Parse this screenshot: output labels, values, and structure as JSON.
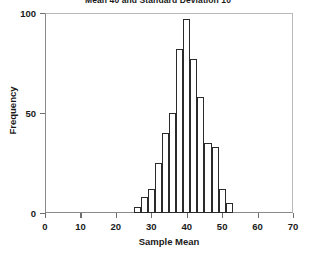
{
  "chart_data": {
    "type": "bar",
    "title": "Mean 40 and Standard Deviation 10",
    "xlabel": "Sample Mean",
    "ylabel": "Frequency",
    "xlim": [
      0,
      70
    ],
    "ylim": [
      0,
      100
    ],
    "xticks": [
      0,
      10,
      20,
      30,
      40,
      50,
      60,
      70
    ],
    "yticks": [
      0,
      50,
      100
    ],
    "grid": false,
    "legend": null,
    "bin_width": 2,
    "bin_edges": [
      25,
      27,
      29,
      31,
      33,
      35,
      37,
      39,
      41,
      43,
      45,
      47,
      49,
      51,
      53
    ],
    "categories": [
      "25-27",
      "27-29",
      "29-31",
      "31-33",
      "33-35",
      "35-37",
      "37-39",
      "39-41",
      "41-43",
      "43-45",
      "45-47",
      "47-49",
      "49-51",
      "51-53"
    ],
    "values": [
      3,
      8,
      12,
      25,
      40,
      50,
      82,
      97,
      77,
      58,
      35,
      33,
      12,
      5
    ],
    "bar_fill": "#ffffff",
    "bar_edge": "#2b2b2b"
  },
  "axes": {
    "x_tick_labels": [
      "0",
      "10",
      "20",
      "30",
      "40",
      "50",
      "60",
      "70"
    ],
    "y_tick_labels": [
      "0",
      "50",
      "100"
    ]
  }
}
